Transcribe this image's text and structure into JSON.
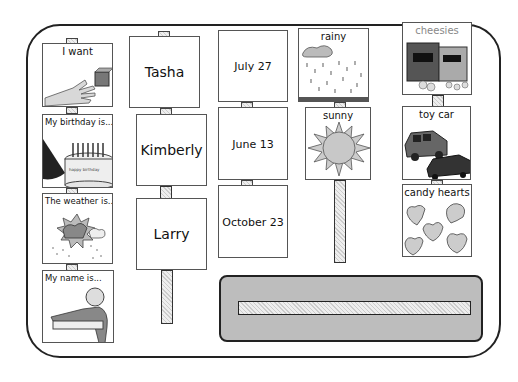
{
  "board": {
    "sentence_starters": [
      {
        "label": "I want",
        "icon": "hand-reaching-block-icon"
      },
      {
        "label": "My birthday is...",
        "icon": "birthday-cake-icon",
        "cake_text": "happy birthday"
      },
      {
        "label": "The weather is...",
        "icon": "weather-storm-icon"
      },
      {
        "label": "My name is...",
        "icon": "person-pointing-icon"
      }
    ],
    "names": [
      "Tasha",
      "Kimberly",
      "Larry"
    ],
    "dates": [
      "July 27",
      "June 13",
      "October 23"
    ],
    "weather": [
      {
        "label": "rainy",
        "icon": "rain-cloud-icon"
      },
      {
        "label": "sunny",
        "icon": "sun-icon"
      }
    ],
    "items": [
      {
        "label": "cheesies",
        "icon": "snack-bags-icon"
      },
      {
        "label": "toy car",
        "icon": "toy-cars-icon"
      },
      {
        "label": "candy hearts",
        "icon": "candy-hearts-icon"
      }
    ],
    "sentence_strip": {
      "label": ""
    }
  },
  "colors": {
    "border": "#222222",
    "strip_fill": "#bdbdbd",
    "card_border": "#555555"
  }
}
